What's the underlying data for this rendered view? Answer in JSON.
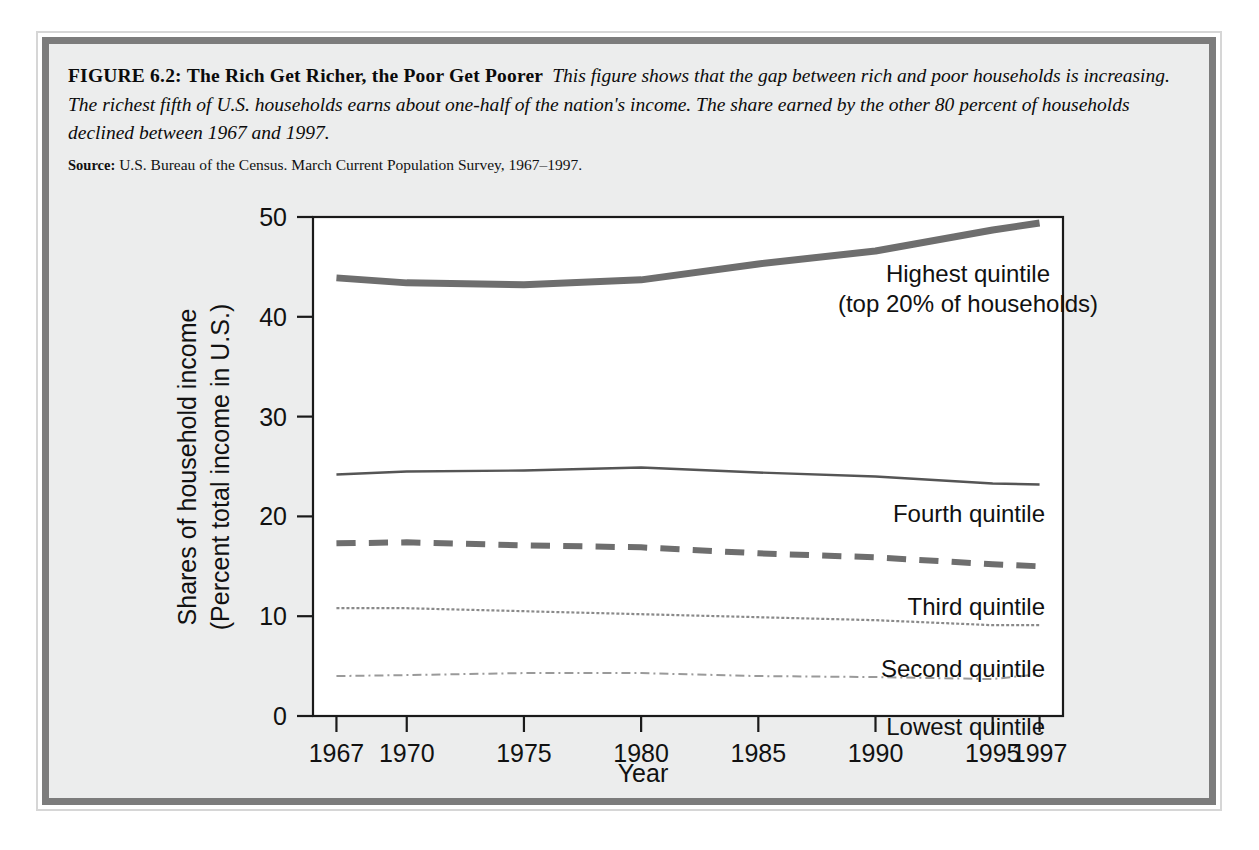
{
  "figure": {
    "label": "FIGURE 6.2:",
    "title": "The Rich Get Richer, the Poor Get Poorer",
    "description": "This figure shows that the gap between rich and poor households is increasing. The richest fifth of U.S. households earns about one-half of the nation's income. The share earned by the other 80 percent of households declined between 1967 and 1997.",
    "source_label": "Source:",
    "source_text": "U.S. Bureau of the Census. March Current Population Survey, 1967–1997."
  },
  "chart_data": {
    "type": "line",
    "title": "The Rich Get Richer, the Poor Get Poorer",
    "xlabel": "Year",
    "ylabel": "Shares of household income (Percent total income in U.S.)",
    "ylabel_line1": "Shares of household income",
    "ylabel_line2": "(Percent total income in U.S.)",
    "xlim": [
      1966,
      1998
    ],
    "ylim": [
      0,
      50
    ],
    "yticks": [
      0,
      10,
      20,
      30,
      40,
      50
    ],
    "ytick_labels": [
      "0",
      "10",
      "20",
      "30",
      "40",
      "50"
    ],
    "xticks": [
      1967,
      1970,
      1975,
      1980,
      1985,
      1990,
      1995,
      1997
    ],
    "xtick_labels": [
      "1967",
      "1970",
      "1975",
      "1980",
      "1985",
      "1990",
      "1995",
      "1997"
    ],
    "grid": false,
    "legend_position": "inline-right",
    "x": [
      1967,
      1970,
      1975,
      1980,
      1985,
      1990,
      1995,
      1997
    ],
    "series": [
      {
        "name": "Highest quintile",
        "label": "Highest quintile",
        "label_line2": "(top 20% of households)",
        "style": "thick-solid",
        "color": "#6e6e6e",
        "width": 7,
        "values": [
          43.9,
          43.4,
          43.2,
          43.7,
          45.3,
          46.6,
          48.7,
          49.4
        ]
      },
      {
        "name": "Fourth quintile",
        "label": "Fourth quintile",
        "style": "thin-solid",
        "color": "#555555",
        "width": 2.4,
        "values": [
          24.2,
          24.5,
          24.6,
          24.9,
          24.4,
          24.0,
          23.3,
          23.2
        ]
      },
      {
        "name": "Third quintile",
        "label": "Third quintile",
        "style": "dashed",
        "color": "#6e6e6e",
        "width": 6,
        "values": [
          17.3,
          17.4,
          17.1,
          16.9,
          16.3,
          15.9,
          15.2,
          15.0
        ]
      },
      {
        "name": "Second quintile",
        "label": "Second quintile",
        "style": "fine-dotted",
        "color": "#8a8a8a",
        "width": 2.2,
        "values": [
          10.8,
          10.8,
          10.5,
          10.2,
          9.9,
          9.6,
          9.1,
          9.1
        ]
      },
      {
        "name": "Lowest quintile",
        "label": "Lowest quintile",
        "style": "dash-dot-fine",
        "color": "#9a9a9a",
        "width": 2.0,
        "values": [
          4.0,
          4.1,
          4.3,
          4.3,
          4.0,
          3.9,
          3.7,
          4.2
        ]
      }
    ]
  }
}
